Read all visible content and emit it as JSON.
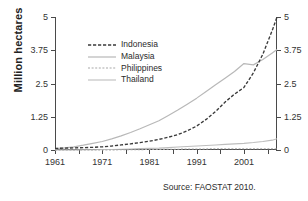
{
  "chart_data": {
    "type": "line",
    "title": "",
    "xlabel": "",
    "ylabel": "Million hectares",
    "xlim": [
      1961,
      2008
    ],
    "ylim": [
      0,
      5
    ],
    "grid": false,
    "legend_position": "upper-left-inside",
    "y_ticks": [
      "0",
      "1.25",
      "2.5",
      "3.75",
      "5"
    ],
    "y_tick_values": [
      0,
      1.25,
      2.5,
      3.75,
      5
    ],
    "y_axis_mirrored": true,
    "x_ticks_labeled": [
      "1961",
      "1971",
      "1981",
      "1991",
      "2001"
    ],
    "x_tick_label_values": [
      1961,
      1971,
      1981,
      1991,
      2001
    ],
    "x_minor_tick_values": [
      1961,
      1966,
      1971,
      1976,
      1981,
      1986,
      1991,
      1996,
      2001,
      2006
    ],
    "annotations": [
      "Source: FAOSTAT 2010."
    ],
    "x": [
      1961,
      1963,
      1965,
      1967,
      1969,
      1971,
      1973,
      1975,
      1977,
      1979,
      1981,
      1983,
      1985,
      1987,
      1989,
      1991,
      1993,
      1995,
      1997,
      1999,
      2001,
      2003,
      2005,
      2007,
      2008
    ],
    "series": [
      {
        "name": "Indonesia",
        "style": "dashed-dark",
        "color": "#3a3a3a",
        "values": [
          0.06,
          0.07,
          0.08,
          0.09,
          0.1,
          0.12,
          0.15,
          0.19,
          0.23,
          0.28,
          0.33,
          0.4,
          0.48,
          0.58,
          0.72,
          0.9,
          1.15,
          1.45,
          1.8,
          2.1,
          2.35,
          2.9,
          3.6,
          4.5,
          5.0
        ]
      },
      {
        "name": "Malaysia",
        "style": "solid-light",
        "color": "#b8b8b8",
        "values": [
          0.05,
          0.08,
          0.12,
          0.18,
          0.25,
          0.32,
          0.42,
          0.53,
          0.66,
          0.8,
          0.95,
          1.1,
          1.3,
          1.5,
          1.72,
          1.95,
          2.2,
          2.45,
          2.7,
          2.95,
          3.25,
          3.2,
          3.4,
          3.65,
          3.78
        ]
      },
      {
        "name": "Philippines",
        "style": "dashed-light",
        "color": "#a8a8a8",
        "values": [
          0.0,
          0.0,
          0.0,
          0.0,
          0.0,
          0.0,
          0.0,
          0.01,
          0.01,
          0.01,
          0.02,
          0.02,
          0.03,
          0.03,
          0.04,
          0.04,
          0.04,
          0.05,
          0.05,
          0.05,
          0.05,
          0.05,
          0.05,
          0.05,
          0.05
        ]
      },
      {
        "name": "Thailand",
        "style": "solid-gray",
        "color": "#bdbdbd",
        "values": [
          0.0,
          0.0,
          0.0,
          0.01,
          0.01,
          0.02,
          0.02,
          0.03,
          0.04,
          0.05,
          0.06,
          0.07,
          0.09,
          0.11,
          0.13,
          0.15,
          0.17,
          0.19,
          0.21,
          0.23,
          0.25,
          0.28,
          0.32,
          0.37,
          0.42
        ]
      }
    ]
  },
  "figure": {
    "y_axis_title": "Million hectares",
    "source_note": "Source: FAOSTAT 2010."
  },
  "legend": {
    "entries": [
      {
        "label": "Indonesia"
      },
      {
        "label": "Malaysia"
      },
      {
        "label": "Philippines"
      },
      {
        "label": "Thailand"
      }
    ]
  }
}
